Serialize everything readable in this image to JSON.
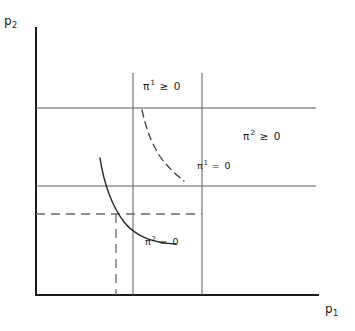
{
  "figure": {
    "title": "",
    "background_color": "#ffffff",
    "line_color": "#3c3c3c",
    "axis_color": "#1a1a1a",
    "text_color": "#1a1a1a",
    "width": 355,
    "height": 331
  },
  "axes": {
    "y_axis": {
      "label_base": "p",
      "label_sub": "2",
      "x": 36,
      "y_top": 28,
      "y_bottom": 295
    },
    "x_axis": {
      "label_base": "p",
      "label_sub": "1",
      "y": 295,
      "x_left": 36,
      "x_right": 318
    }
  },
  "grid_lines": {
    "horizontal": [
      {
        "name": "upper-horizontal-line",
        "y": 108,
        "x1": 36,
        "x2": 316
      },
      {
        "name": "lower-horizontal-line",
        "y": 186,
        "x1": 36,
        "x2": 316
      }
    ],
    "vertical": [
      {
        "name": "left-vertical-line",
        "x": 133,
        "y1": 73,
        "y2": 295
      },
      {
        "name": "right-vertical-line",
        "x": 202,
        "y1": 73,
        "y2": 295
      }
    ]
  },
  "dashed_guides": {
    "vertical": {
      "name": "equilibrium-vertical-guide",
      "x": 116,
      "y1": 214,
      "y2": 295
    },
    "horizontal": {
      "name": "equilibrium-horizontal-guide",
      "y": 214,
      "x1": 36,
      "x2": 202
    }
  },
  "curves": [
    {
      "name": "pi1-reaction-curve",
      "style": "dashed",
      "path": "M 142,110 C 147,133 155,152 166,164 C 173,172 179,177 184,181",
      "label": {
        "base": "π",
        "sup": "1",
        "relation": "= 0"
      }
    },
    {
      "name": "pi2-reaction-curve",
      "style": "solid",
      "path": "M 100,158 C 104,184 112,206 124,222 C 137,238 155,243 176,244",
      "label": {
        "base": "π",
        "sup": "2",
        "relation": "= 0"
      }
    }
  ],
  "region_labels": [
    {
      "name": "pi1-nonnegative-region",
      "base": "π",
      "sup": "1",
      "relation": "≥ 0"
    },
    {
      "name": "pi2-nonnegative-region",
      "base": "π",
      "sup": "2",
      "relation": "≥ 0"
    }
  ]
}
